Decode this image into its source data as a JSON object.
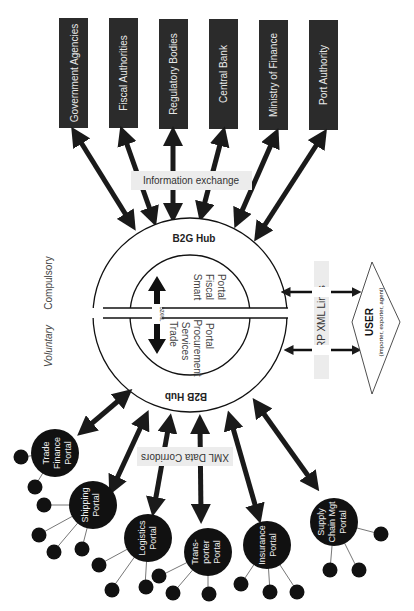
{
  "government_boxes": [
    {
      "label": "Government Agencies"
    },
    {
      "label": "Fiscal Authorities"
    },
    {
      "label": "Regulatory Bodies"
    },
    {
      "label": "Central Bank"
    },
    {
      "label": "Ministry of Finance"
    },
    {
      "label": "Port Authority"
    }
  ],
  "labels": {
    "info_exchange": "Information exchange",
    "b2g_hub": "B2G Hub",
    "b2b_hub": "B2B Hub",
    "compulsory": "Compulsory",
    "voluntary": "Voluntary",
    "smart_fiscal": [
      "Smart",
      "Fiscal",
      "Portal"
    ],
    "trade_services": [
      "Trade",
      "Services",
      "Procurement",
      "Portal"
    ],
    "b2xml": "B2XML",
    "erp_links": "ERP XML Links",
    "user_title": "USER",
    "user_sub": "(importer, exporter, agent)",
    "xml_corridors": "XML Data Corridors"
  },
  "portals": [
    {
      "lines": [
        "Trade",
        "Finance",
        "Portal"
      ]
    },
    {
      "lines": [
        "Shipping",
        "Portal"
      ]
    },
    {
      "lines": [
        "Logistics",
        "Portal"
      ]
    },
    {
      "lines": [
        "Trans-",
        "porter",
        "Portal"
      ]
    },
    {
      "lines": [
        "Insurance",
        "Portal"
      ]
    },
    {
      "lines": [
        "Supply",
        "Chain Mgt",
        "Portal"
      ]
    }
  ],
  "colors": {
    "box_fill": "#2b2b2b",
    "arrow": "#1a1a1a",
    "label_bg": "#ececec",
    "box_text": "#e8e8e8"
  }
}
